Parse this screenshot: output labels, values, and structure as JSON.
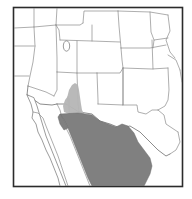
{
  "figure": {
    "type": "species-range-map",
    "region": "Southwestern United States and Northern Mexico",
    "title": "",
    "caption": "",
    "background_color": "#ffffff",
    "frame_color": "#2b2b2b",
    "frame_bounds": {
      "x": 13,
      "y": 7,
      "width": 170,
      "height": 180
    }
  },
  "legend": {
    "visible": false,
    "entries": [
      {
        "label": "Core range",
        "color": "#808080"
      },
      {
        "label": "Marginal range",
        "color": "#b5b5b5"
      }
    ]
  },
  "layers": {
    "boundaries": {
      "name": "state-and-country-boundaries",
      "stroke_color": "#8b8b8b",
      "stroke_width": 0.7
    },
    "coastline": {
      "name": "coastline",
      "stroke_color": "#7a7a7a"
    },
    "range_core": {
      "name": "core-distribution-range",
      "color": "#808080",
      "description": "Northern mainland Mexico, Sonora and Chihuahua"
    },
    "range_spur": {
      "name": "northern-range-extension",
      "color": "#b5b5b5",
      "description": "Southeastern Arizona and southwestern New Mexico"
    },
    "lake": {
      "name": "great-salt-lake",
      "color": "#ffffff"
    }
  },
  "features": {
    "states": [
      "Oregon",
      "Idaho",
      "Wyoming",
      "Nebraska",
      "Iowa",
      "California",
      "Nevada",
      "Utah",
      "Colorado",
      "Kansas",
      "Missouri",
      "Arizona",
      "New Mexico",
      "Oklahoma",
      "Texas"
    ],
    "countries": [
      "United States",
      "Mexico"
    ],
    "water_bodies": [
      "Great Salt Lake",
      "Gulf of California",
      "Gulf of Mexico",
      "Pacific Ocean"
    ],
    "peninsulas": [
      "Baja California"
    ]
  }
}
